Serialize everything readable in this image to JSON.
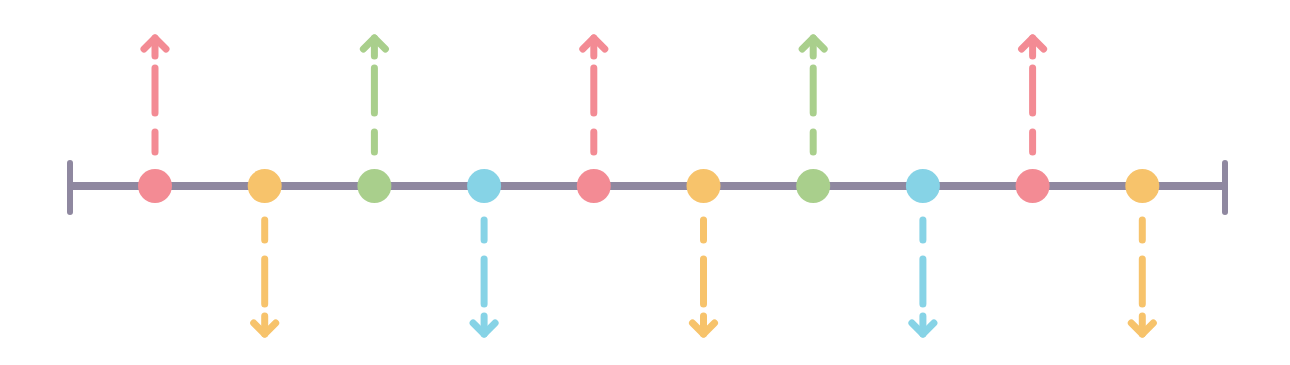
{
  "diagram": {
    "line_color": "#8f88a0",
    "colors": {
      "red": "#f38b94",
      "orange": "#f7c36b",
      "green": "#a9cf8c",
      "blue": "#86d3e6"
    },
    "events": [
      {
        "color": "red",
        "direction": "up"
      },
      {
        "color": "orange",
        "direction": "down"
      },
      {
        "color": "green",
        "direction": "up"
      },
      {
        "color": "blue",
        "direction": "down"
      },
      {
        "color": "red",
        "direction": "up"
      },
      {
        "color": "orange",
        "direction": "down"
      },
      {
        "color": "green",
        "direction": "up"
      },
      {
        "color": "blue",
        "direction": "down"
      },
      {
        "color": "red",
        "direction": "up"
      },
      {
        "color": "orange",
        "direction": "down"
      }
    ]
  }
}
